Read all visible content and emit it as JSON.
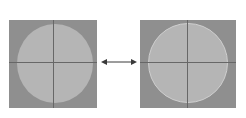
{
  "diagram": {
    "colors": {
      "background": "#ffffff",
      "square": "#8f8f8f",
      "circle": "#b5b5b5",
      "crosshair": "#676767",
      "ring": "#cfcfcf",
      "arrow": "#3a3a3a"
    },
    "panels": [
      {
        "name": "left",
        "shape": "square with inscribed circle and crosshair"
      },
      {
        "name": "right",
        "shape": "square with larger inscribed circle, lighter outline ring, and crosshair"
      }
    ],
    "connector": {
      "type": "double-headed-arrow",
      "direction": "horizontal"
    }
  }
}
